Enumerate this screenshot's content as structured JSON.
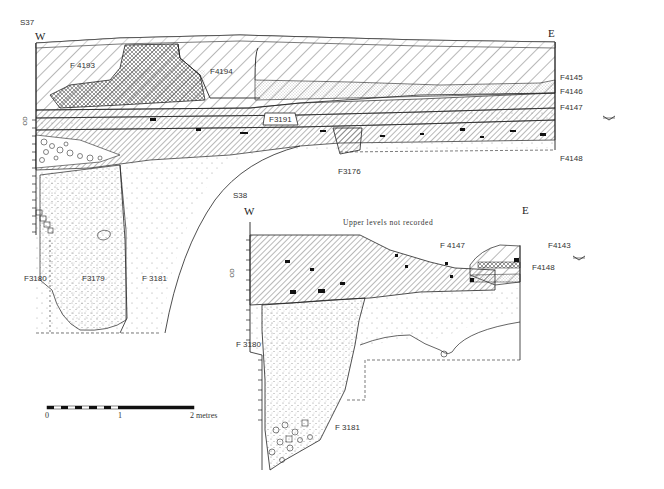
{
  "section_s37": {
    "title": "S37",
    "west_label": "W",
    "east_label": "E",
    "datum_label": "OD",
    "features": {
      "f4193": "F 4193",
      "f4194": "F4194",
      "f3191": "F3191",
      "f3176": "F3176",
      "f4145": "F4145",
      "f4146": "F4146",
      "f4147": "F4147",
      "f4148": "F4148",
      "f3180": "F3180",
      "f3179": "F3179",
      "f3181": "F 3181"
    },
    "layer_numbers": [
      "1",
      "2",
      "3",
      "6",
      "9",
      "12",
      "17",
      "19",
      "20",
      "21",
      "22"
    ]
  },
  "section_s38": {
    "title": "S38",
    "west_label": "W",
    "east_label": "E",
    "datum_label": "OD",
    "note": "Upper levels not recorded",
    "features": {
      "f4147": "F 4147",
      "f4143": "F4143",
      "f4148": "F4148",
      "f3180": "F 3180",
      "f3181": "F 3181"
    },
    "layer_numbers": [
      "2",
      "6",
      "9",
      "11",
      "12",
      "13",
      "15",
      "19",
      "22"
    ]
  },
  "scale_bar": {
    "start_label": "0",
    "mid_label": "1",
    "end_label": "2 metres"
  },
  "colors": {
    "ink": "#222222",
    "paper": "#ffffff",
    "stipple": "#9a9a9a"
  }
}
